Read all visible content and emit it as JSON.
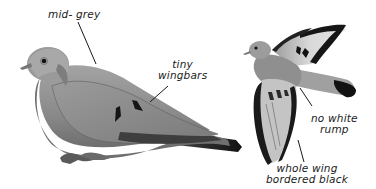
{
  "figure": {
    "colors": {
      "background": "#ffffff",
      "body_grey": "#8e8e8e",
      "light_grey": "#bdbdbd",
      "dark_grey": "#4a4a4a",
      "black": "#111111",
      "ink": "#1a1a1a"
    }
  },
  "labels": {
    "mid_grey": "mid- grey",
    "tiny_wingbars_line1": "tiny",
    "tiny_wingbars_line2": "wingbars",
    "no_white_rump_line1": "no white",
    "no_white_rump_line2": "rump",
    "whole_wing_line1": "whole wing",
    "whole_wing_line2": "bordered black"
  }
}
